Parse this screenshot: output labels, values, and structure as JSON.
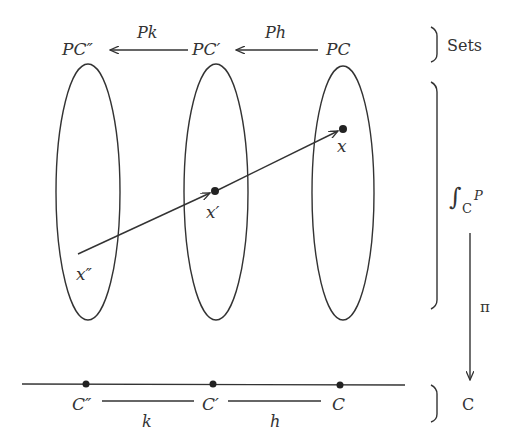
{
  "diagram": {
    "top_row": {
      "objects": [
        "PC″",
        "PC′",
        "PC"
      ],
      "arrows": [
        {
          "from": "PC′",
          "to": "PC″",
          "label": "Pk"
        },
        {
          "from": "PC",
          "to": "PC′",
          "label": "Ph"
        }
      ],
      "bracket_label": "Sets"
    },
    "fibers": {
      "points": [
        "x″",
        "x′",
        "x"
      ],
      "bracket_label_integral": "∫",
      "bracket_label_sub": "C",
      "bracket_label_sup": "P"
    },
    "projection": {
      "label": "π"
    },
    "base": {
      "objects": [
        "C″",
        "C′",
        "C"
      ],
      "morphisms": [
        "k",
        "h"
      ],
      "bracket_label": "C"
    }
  }
}
